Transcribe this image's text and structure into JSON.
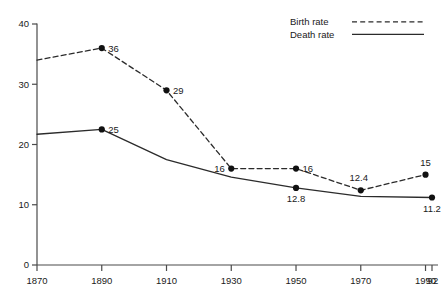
{
  "chart_data": {
    "type": "line",
    "title": "",
    "xlabel": "",
    "ylabel": "",
    "ylim": [
      0,
      40
    ],
    "yticks": [
      "0",
      "10",
      "20",
      "30",
      "40"
    ],
    "ytick_values": [
      0,
      10,
      20,
      30,
      40
    ],
    "xticks": [
      "1870",
      "1890",
      "1910",
      "1930",
      "1950",
      "1970",
      "1990",
      "'92"
    ],
    "xtick_values": [
      1870,
      1890,
      1910,
      1930,
      1950,
      1970,
      1990,
      1992
    ],
    "grid": false,
    "legend_position": "top-right",
    "series": [
      {
        "name": "Birth rate",
        "style": "dashed",
        "x": [
          1870,
          1890,
          1910,
          1930,
          1950,
          1970,
          1990
        ],
        "values": [
          34,
          36,
          29,
          16,
          16,
          12.4,
          15
        ],
        "point_labels": [
          "",
          "36",
          "29",
          "16",
          "16",
          "12.4",
          "15"
        ],
        "markers": [
          false,
          true,
          true,
          true,
          true,
          true,
          true
        ],
        "label_anchor": [
          "",
          "right",
          "right",
          "left",
          "right",
          "above-left",
          "above"
        ]
      },
      {
        "name": "Death rate",
        "style": "solid",
        "x": [
          1870,
          1890,
          1910,
          1930,
          1950,
          1970,
          1992
        ],
        "values": [
          21.7,
          22.5,
          17.5,
          14.6,
          12.8,
          11.4,
          11.2
        ],
        "point_labels": [
          "",
          "25",
          "",
          "",
          "12.8",
          "",
          "11.2"
        ],
        "markers": [
          false,
          true,
          false,
          false,
          true,
          false,
          true
        ],
        "label_anchor": [
          "",
          "right",
          "",
          "",
          "below",
          "",
          "below"
        ]
      }
    ],
    "legend": [
      {
        "label": "Birth rate",
        "style": "dashed"
      },
      {
        "label": "Death rate",
        "style": "solid"
      }
    ]
  }
}
